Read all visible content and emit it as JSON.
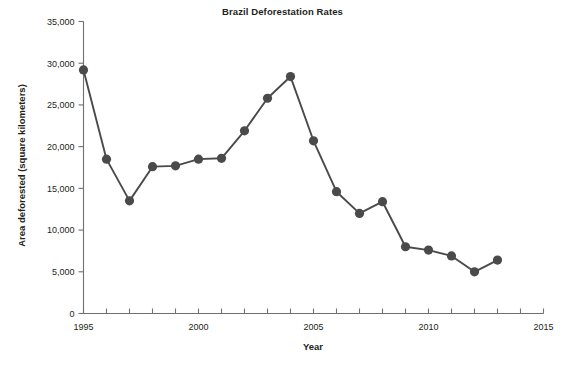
{
  "chart_data": {
    "type": "line",
    "title": "Brazil Deforestation Rates",
    "xlabel": "Year",
    "ylabel": "Area deforested (square kilometers)",
    "xlim": [
      1995,
      2015
    ],
    "ylim": [
      0,
      35000
    ],
    "grid": false,
    "legend": null,
    "marker": "filled-circle",
    "series_color": "#4a4a4a",
    "x": [
      1995,
      1996,
      1997,
      1998,
      1999,
      2000,
      2001,
      2002,
      2003,
      2004,
      2005,
      2006,
      2007,
      2008,
      2009,
      2010,
      2011,
      2012,
      2013
    ],
    "values": [
      29200,
      18500,
      13500,
      17600,
      17700,
      18500,
      18600,
      21900,
      25800,
      28400,
      20700,
      14600,
      12000,
      13400,
      8000,
      7600,
      6900,
      5000,
      6400
    ],
    "series": [
      {
        "name": "Area deforested",
        "values": [
          29200,
          18500,
          13500,
          17600,
          17700,
          18500,
          18600,
          21900,
          25800,
          28400,
          20700,
          14600,
          12000,
          13400,
          8000,
          7600,
          6900,
          5000,
          6400
        ]
      }
    ],
    "y_ticks": [
      0,
      5000,
      10000,
      15000,
      20000,
      25000,
      30000,
      35000
    ],
    "y_tick_labels": [
      "0",
      "5,000",
      "10,000",
      "15,000",
      "20,000",
      "25,000",
      "30,000",
      "35,000"
    ],
    "x_ticks": [
      1995,
      1996,
      1997,
      1998,
      1999,
      2000,
      2001,
      2002,
      2003,
      2004,
      2005,
      2006,
      2007,
      2008,
      2009,
      2010,
      2011,
      2012,
      2013,
      2014,
      2015
    ],
    "x_tick_labels_major": [
      "1995",
      "2000",
      "2005",
      "2010",
      "2015"
    ],
    "x_major_ticks": [
      1995,
      2000,
      2005,
      2010,
      2015
    ]
  }
}
